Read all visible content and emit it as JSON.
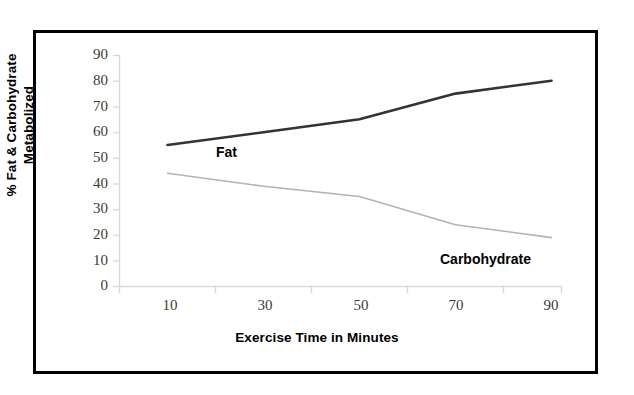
{
  "chart_data": {
    "type": "line",
    "title": "",
    "xlabel": "Exercise Time in Minutes",
    "ylabel": "% Fat & Carbohydrate Metabolized",
    "ylabel_line1": "% Fat & Carbohydrate",
    "ylabel_line2": "Metabolized",
    "x": [
      10,
      30,
      50,
      70,
      90
    ],
    "xtick_labels": [
      "10",
      "30",
      "50",
      "70",
      "90"
    ],
    "ytick_labels": [
      "90",
      "80",
      "70",
      "60",
      "50",
      "40",
      "30",
      "20",
      "10",
      "0"
    ],
    "xlim": [
      0,
      100
    ],
    "ylim": [
      0,
      90
    ],
    "grid": false,
    "legend_position": "inline-annotations",
    "series": [
      {
        "name": "Fat",
        "label": "Fat",
        "color": "#333333",
        "width": 2.6,
        "values": [
          55,
          60,
          65,
          75,
          80
        ]
      },
      {
        "name": "Carbohydrate",
        "label": "Carbohydrate",
        "color": "#b3b3b3",
        "width": 1.6,
        "values": [
          44,
          39,
          35,
          24,
          19
        ]
      }
    ],
    "annotations": [
      {
        "text": "Fat",
        "x": 30,
        "y": 50
      },
      {
        "text": "Carbohydrate",
        "x": 72,
        "y": 12
      }
    ],
    "axis_color": "#d9d9d9",
    "frame_color": "#000000"
  }
}
